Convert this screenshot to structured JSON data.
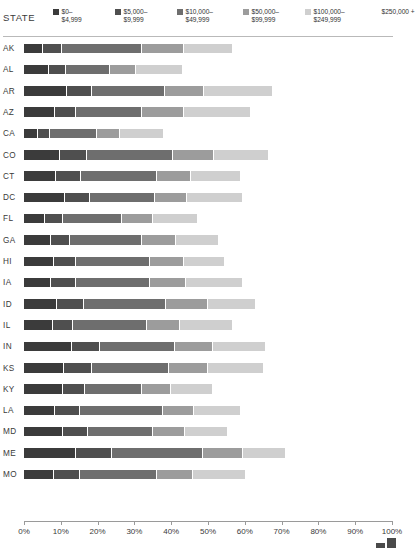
{
  "header": {
    "state_column_title": "STATE",
    "legend": [
      {
        "label_line1": "$0–",
        "label_line2": "$4,999",
        "color": "#3b3b3b",
        "x": 0
      },
      {
        "label_line1": "$5,000–",
        "label_line2": "$9,999",
        "color": "#4f4f4f",
        "x": 62
      },
      {
        "label_line1": "$10,000–",
        "label_line2": "$49,999",
        "color": "#6e6e6e",
        "x": 124
      },
      {
        "label_line1": "$50,000–",
        "label_line2": "$99,999",
        "color": "#9c9c9c",
        "x": 190
      },
      {
        "label_line1": "$100,000–",
        "label_line2": "$249,999",
        "color": "#cfcfcf",
        "x": 252
      },
      {
        "label_line1": "$250,000 +",
        "label_line2": "",
        "color": "#ffffff",
        "x": 320
      }
    ]
  },
  "chart_data": {
    "type": "bar",
    "subtype": "stacked-horizontal",
    "title": "",
    "xlabel": "",
    "ylabel": "STATE",
    "xlim": [
      0,
      100
    ],
    "xunit": "%",
    "grid": false,
    "legend_position": "top",
    "tick_labels": [
      "0%",
      "10%",
      "20%",
      "30%",
      "40%",
      "50%",
      "60%",
      "70%",
      "80%",
      "90%",
      "100%"
    ],
    "tick_values": [
      0,
      10,
      20,
      30,
      40,
      50,
      60,
      70,
      80,
      90,
      100
    ],
    "series": [
      {
        "name": "$0–$4,999",
        "color": "#3b3b3b"
      },
      {
        "name": "$5,000–$9,999",
        "color": "#4f4f4f"
      },
      {
        "name": "$10,000–$49,999",
        "color": "#6e6e6e"
      },
      {
        "name": "$50,000–$99,999",
        "color": "#9c9c9c"
      },
      {
        "name": "$100,000–$249,999",
        "color": "#cfcfcf"
      },
      {
        "name": "$250,000 +",
        "color": "#ffffff"
      }
    ],
    "categories": [
      "AK",
      "AL",
      "AR",
      "AZ",
      "CA",
      "CO",
      "CT",
      "DC",
      "FL",
      "GA",
      "HI",
      "IA",
      "ID",
      "IL",
      "IN",
      "KS",
      "KY",
      "LA",
      "MD",
      "ME",
      "MO"
    ],
    "values": [
      [
        5.2,
        5.2,
        21.7,
        11.4,
        13.0,
        43.5
      ],
      [
        6.8,
        4.6,
        12.0,
        7.1,
        12.5,
        57.0
      ],
      [
        11.7,
        6.8,
        19.8,
        10.6,
        18.5,
        32.6
      ],
      [
        8.4,
        5.7,
        17.9,
        11.4,
        17.9,
        38.7
      ],
      [
        3.8,
        3.3,
        12.8,
        6.2,
        11.7,
        62.2
      ],
      [
        9.8,
        7.3,
        23.4,
        11.1,
        14.7,
        33.7
      ],
      [
        8.7,
        6.8,
        20.7,
        9.2,
        13.3,
        41.3
      ],
      [
        11.1,
        6.8,
        17.7,
        8.7,
        14.9,
        40.8
      ],
      [
        5.7,
        4.9,
        16.0,
        8.4,
        12.0,
        53.0
      ],
      [
        7.3,
        5.2,
        19.6,
        9.2,
        11.4,
        47.3
      ],
      [
        8.2,
        6.0,
        20.1,
        9.2,
        10.9,
        45.6
      ],
      [
        7.3,
        6.8,
        20.1,
        9.8,
        15.2,
        40.8
      ],
      [
        9.0,
        7.3,
        22.3,
        11.4,
        12.8,
        37.2
      ],
      [
        7.9,
        5.4,
        20.1,
        9.0,
        14.1,
        43.5
      ],
      [
        13.0,
        7.6,
        20.4,
        10.3,
        14.1,
        34.6
      ],
      [
        10.9,
        7.6,
        20.9,
        10.6,
        14.9,
        35.1
      ],
      [
        10.6,
        6.0,
        15.5,
        7.9,
        11.1,
        48.9
      ],
      [
        8.4,
        6.8,
        22.6,
        8.4,
        12.5,
        41.3
      ],
      [
        10.6,
        6.8,
        17.7,
        8.7,
        11.4,
        44.8
      ],
      [
        14.1,
        9.8,
        24.7,
        10.9,
        11.4,
        29.1
      ],
      [
        8.2,
        7.1,
        20.9,
        9.8,
        14.1,
        39.9
      ]
    ]
  }
}
